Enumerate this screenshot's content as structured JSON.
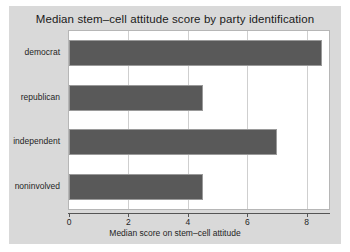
{
  "chart_data": {
    "type": "bar",
    "orientation": "horizontal",
    "title": "Median stem–cell attitude score by party identification",
    "xlabel": "Median score on stem–cell attitude",
    "ylabel": "",
    "categories": [
      "democrat",
      "republican",
      "independent",
      "noninvolved"
    ],
    "values": [
      8.5,
      4.5,
      7.0,
      4.5
    ],
    "xlim": [
      0,
      8.75
    ],
    "xticks": [
      0,
      2,
      4,
      6,
      8
    ],
    "xtick_labels": [
      "0",
      "2",
      "4",
      "6",
      "8"
    ],
    "grid": "vertical",
    "legend": null,
    "colors": {
      "bar_fill": "#595959",
      "bar_edge": "#9a9a9a",
      "figure_background": "#d9d9d9",
      "plot_background": "#ffffff",
      "gridline": "#cfcfcf",
      "axis": "#555555",
      "text": "#1f1f1f"
    }
  }
}
